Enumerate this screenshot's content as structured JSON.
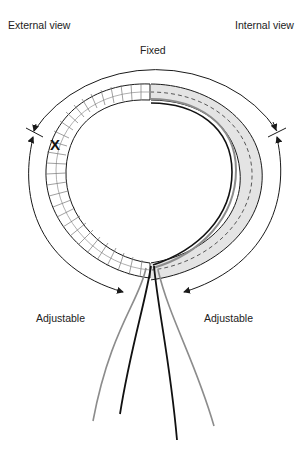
{
  "labels": {
    "external_view": "External view",
    "internal_view": "Internal view",
    "fixed": "Fixed",
    "adjustable_left": "Adjustable",
    "adjustable_right": "Adjustable"
  },
  "colors": {
    "line": "#1a1a1a",
    "segment_grid": "#9a9a9a",
    "internal_fill": "#e4e4e4",
    "wire_gray": "#8c8c8c",
    "wire_black": "#111111"
  },
  "markers": {
    "x_mark": "X",
    "strand_count": 4
  }
}
